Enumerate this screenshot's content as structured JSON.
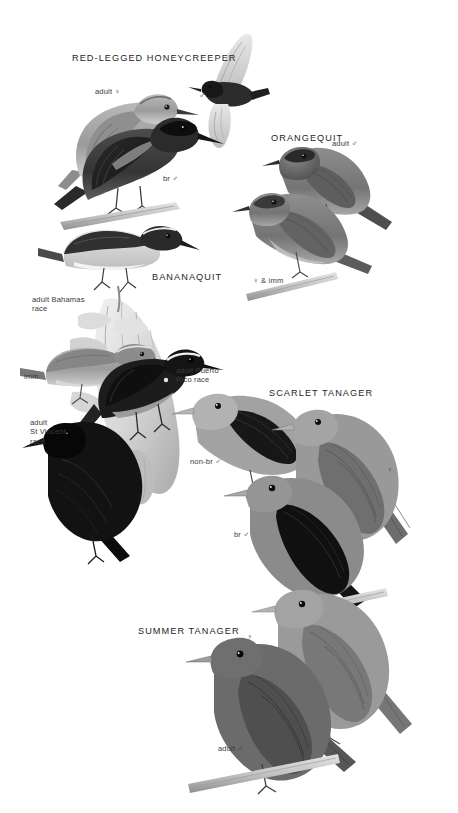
{
  "page": {
    "type": "field-guide-plate",
    "background_color": "#ffffff",
    "width": 458,
    "height": 813,
    "text_color": "#2b2b2b",
    "illustration_style": "grayscale-halftone-bird-plate"
  },
  "species_headings": [
    {
      "id": "red-legged-honeycreeper",
      "label": "RED-LEGGED HONEYCREEPER",
      "x": 72,
      "y": 53
    },
    {
      "id": "orangequit",
      "label": "ORANGEQUIT",
      "x": 271,
      "y": 133
    },
    {
      "id": "bananaquit",
      "label": "BANANAQUIT",
      "x": 152,
      "y": 272
    },
    {
      "id": "scarlet-tanager",
      "label": "SCARLET TANAGER",
      "x": 269,
      "y": 388
    },
    {
      "id": "summer-tanager",
      "label": "SUMMER TANAGER",
      "x": 138,
      "y": 626
    }
  ],
  "plumage_labels": [
    {
      "id": "honeycreeper-adult-female",
      "label": "adult ♀",
      "x": 95,
      "y": 88,
      "align": "left"
    },
    {
      "id": "honeycreeper-flying-male",
      "label": "♂",
      "x": 199,
      "y": 92,
      "align": "left"
    },
    {
      "id": "honeycreeper-breeding-male",
      "label": "br ♂",
      "x": 163,
      "y": 175,
      "align": "left"
    },
    {
      "id": "orangequit-adult-male",
      "label": "adult ♂",
      "x": 332,
      "y": 140,
      "align": "left"
    },
    {
      "id": "orangequit-female-imm",
      "label": "♀ & imm",
      "x": 253,
      "y": 277,
      "align": "left"
    },
    {
      "id": "bananaquit-adult-bahamas",
      "label": "adult Bahamas\nrace",
      "x": 32,
      "y": 295,
      "align": "left"
    },
    {
      "id": "bananaquit-imm",
      "label": "imm",
      "x": 24,
      "y": 373,
      "align": "left"
    },
    {
      "id": "bananaquit-adult-puerto-rico",
      "label": "adult Puerto\nRico race",
      "x": 176,
      "y": 366,
      "align": "left"
    },
    {
      "id": "bananaquit-adult-st-vincent",
      "label": "adult\nSt Vincent\nrace",
      "x": 30,
      "y": 418,
      "align": "left"
    },
    {
      "id": "scarlet-non-breeding-male",
      "label": "non-br ♂",
      "x": 190,
      "y": 458,
      "align": "left"
    },
    {
      "id": "scarlet-female",
      "label": "♀",
      "x": 387,
      "y": 466,
      "align": "left"
    },
    {
      "id": "scarlet-breeding-male",
      "label": "br ♂",
      "x": 234,
      "y": 531,
      "align": "left"
    },
    {
      "id": "summer-female",
      "label": "♀",
      "x": 247,
      "y": 633,
      "align": "left"
    },
    {
      "id": "summer-adult-male",
      "label": "adult ♂",
      "x": 218,
      "y": 745,
      "align": "left"
    }
  ],
  "illustrations": [
    {
      "id": "honeycreeper-female-bird",
      "subject": "Red-legged Honeycreeper adult female perched"
    },
    {
      "id": "honeycreeper-flying-male-bird",
      "subject": "Red-legged Honeycreeper male in flight"
    },
    {
      "id": "honeycreeper-breeding-male-bird",
      "subject": "Red-legged Honeycreeper breeding male perched on branch"
    },
    {
      "id": "orangequit-male-bird",
      "subject": "Orangequit adult male perched"
    },
    {
      "id": "orangequit-female-bird",
      "subject": "Orangequit female and immature perched on branch"
    },
    {
      "id": "bananaquit-bahamas-bird",
      "subject": "Bananaquit adult Bahamas race on banana flower"
    },
    {
      "id": "bananaquit-imm-bird",
      "subject": "Bananaquit immature"
    },
    {
      "id": "bananaquit-puerto-rico-bird",
      "subject": "Bananaquit adult Puerto Rico race"
    },
    {
      "id": "bananaquit-st-vincent-bird",
      "subject": "Bananaquit adult St Vincent race, dark morph"
    },
    {
      "id": "banana-flower-plant",
      "subject": "Banana flower inflorescence"
    },
    {
      "id": "scarlet-nonbr-male-bird",
      "subject": "Scarlet Tanager non-breeding male"
    },
    {
      "id": "scarlet-female-bird",
      "subject": "Scarlet Tanager female"
    },
    {
      "id": "scarlet-br-male-bird",
      "subject": "Scarlet Tanager breeding male"
    },
    {
      "id": "summer-female-bird",
      "subject": "Summer Tanager female"
    },
    {
      "id": "summer-male-bird",
      "subject": "Summer Tanager adult male"
    }
  ]
}
